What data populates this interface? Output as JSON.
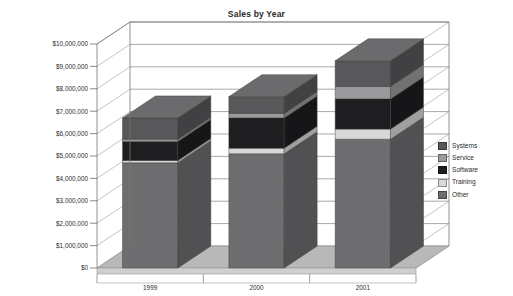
{
  "chart_data": {
    "type": "bar",
    "subtype": "stacked-column-3d",
    "title": "Sales by Year",
    "xlabel": "",
    "ylabel": "",
    "categories": [
      "1999",
      "2000",
      "2001"
    ],
    "series": [
      {
        "name": "Systems",
        "color": "#58585a",
        "values": [
          950000,
          750000,
          1150000
        ]
      },
      {
        "name": "Service",
        "color": "#9a9a9c",
        "values": [
          100000,
          200000,
          550000
        ]
      },
      {
        "name": "Software",
        "color": "#1e1e20",
        "values": [
          850000,
          1350000,
          1350000
        ]
      },
      {
        "name": "Training",
        "color": "#d8d8d8",
        "values": [
          100000,
          250000,
          450000
        ]
      },
      {
        "name": "Other",
        "color": "#6e6e70",
        "values": [
          4700000,
          5100000,
          5750000
        ]
      }
    ],
    "stack_order_bottom_to_top": [
      "Other",
      "Training",
      "Software",
      "Service",
      "Systems"
    ],
    "totals": [
      6700000,
      7650000,
      9250000
    ],
    "ylim": [
      0,
      10000000
    ],
    "ytick_values": [
      0,
      1000000,
      2000000,
      3000000,
      4000000,
      5000000,
      6000000,
      7000000,
      8000000,
      9000000,
      10000000
    ],
    "ytick_labels": [
      "$0",
      "$1,000,000",
      "$2,000,000",
      "$3,000,000",
      "$4,000,000",
      "$5,000,000",
      "$6,000,000",
      "$7,000,000",
      "$8,000,000",
      "$9,000,000",
      "$10,000,000"
    ],
    "grid": true,
    "legend_position": "right",
    "legend_entries": [
      "Systems",
      "Service",
      "Software",
      "Training",
      "Other"
    ],
    "plot_background": "#ffffff",
    "floor_color": "#b8b8b8",
    "axis_line_color": "#8a8a8a"
  }
}
